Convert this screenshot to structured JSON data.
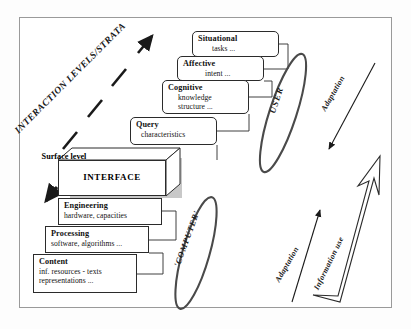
{
  "figure": {
    "title_axis_label": "INTERACTION LEVELS/STRATA",
    "frame_color": "#9a9a9a",
    "line_color": "#2b2b2b",
    "shadow_color": "#c8c8c8"
  },
  "strata": {
    "user_side": [
      {
        "head": "Situational",
        "sub": "tasks ..."
      },
      {
        "head": "Affective",
        "sub": "intent ..."
      },
      {
        "head": "Cognitive",
        "sub": "knowledge\nstructure ..."
      },
      {
        "head": "Query",
        "sub": "characteristics"
      }
    ],
    "interface": {
      "top_face_label": "Surface level",
      "front_face_label": "INTERFACE"
    },
    "computer_side": [
      {
        "head": "Engineering",
        "sub": "hardware, capacities"
      },
      {
        "head": "Processing",
        "sub": "software, algorithms ..."
      },
      {
        "head": "Content",
        "sub": "inf. resources - texts\nrepresentations ..."
      }
    ]
  },
  "actors": {
    "user_label": "USER",
    "computer_label": "'COMPUTER'"
  },
  "flows": {
    "adaptation_top": "Adaptation",
    "adaptation_bottom": "Adaptation",
    "information_use": "Information use"
  },
  "subs": {
    "cognitive_line1": "knowledge",
    "cognitive_line2": "structure ...",
    "content_line1": "inf. resources - texts",
    "content_line2": "representations ..."
  }
}
